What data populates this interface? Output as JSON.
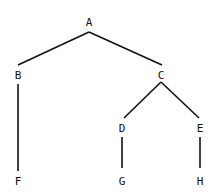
{
  "diagram": {
    "type": "tree",
    "nodes": [
      {
        "id": "A",
        "label": "A",
        "x": 89,
        "y": 22
      },
      {
        "id": "B",
        "label": "B",
        "x": 18,
        "y": 75
      },
      {
        "id": "C",
        "label": "C",
        "x": 161,
        "y": 75
      },
      {
        "id": "D",
        "label": "D",
        "x": 122,
        "y": 128
      },
      {
        "id": "E",
        "label": "E",
        "x": 200,
        "y": 128
      },
      {
        "id": "F",
        "label": "F",
        "x": 18,
        "y": 181
      },
      {
        "id": "G",
        "label": "G",
        "x": 122,
        "y": 181
      },
      {
        "id": "H",
        "label": "H",
        "x": 200,
        "y": 181
      }
    ],
    "edges": [
      {
        "from": "A",
        "to": "B",
        "x1": 89,
        "y1": 32,
        "x2": 18,
        "y2": 65
      },
      {
        "from": "A",
        "to": "C",
        "x1": 89,
        "y1": 32,
        "x2": 162,
        "y2": 65
      },
      {
        "from": "B",
        "to": "F",
        "x1": 18,
        "y1": 84,
        "x2": 18,
        "y2": 171
      },
      {
        "from": "C",
        "to": "D",
        "x1": 161,
        "y1": 82,
        "x2": 124,
        "y2": 118
      },
      {
        "from": "C",
        "to": "E",
        "x1": 161,
        "y1": 82,
        "x2": 199,
        "y2": 118
      },
      {
        "from": "D",
        "to": "G",
        "x1": 122,
        "y1": 137,
        "x2": 122,
        "y2": 168
      },
      {
        "from": "E",
        "to": "H",
        "x1": 200,
        "y1": 137,
        "x2": 200,
        "y2": 168
      }
    ]
  }
}
